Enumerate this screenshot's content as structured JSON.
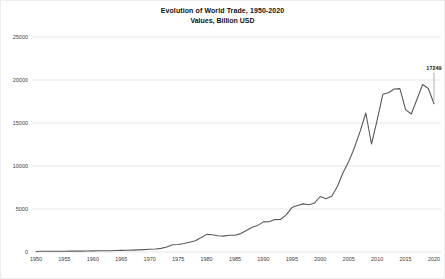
{
  "window": {
    "background": "#ffffff",
    "frame_color": "#ececec"
  },
  "chart_data": {
    "type": "line",
    "title": "Evolution of World Trade, 1950-2020",
    "subtitle": "Values, Billion USD",
    "xlabel": "",
    "ylabel": "",
    "grid": true,
    "legend": false,
    "ylim": [
      0,
      25000
    ],
    "y_ticks": [
      0,
      5000,
      10000,
      15000,
      20000,
      25000
    ],
    "x_tick_step": 5,
    "x_ticks": [
      1950,
      1955,
      1960,
      1965,
      1970,
      1975,
      1980,
      1985,
      1990,
      1995,
      2000,
      2005,
      2010,
      2015,
      2020
    ],
    "x": [
      1950,
      1951,
      1952,
      1953,
      1954,
      1955,
      1956,
      1957,
      1958,
      1959,
      1960,
      1961,
      1962,
      1963,
      1964,
      1965,
      1966,
      1967,
      1968,
      1969,
      1970,
      1971,
      1972,
      1973,
      1974,
      1975,
      1976,
      1977,
      1978,
      1979,
      1980,
      1981,
      1982,
      1983,
      1984,
      1985,
      1986,
      1987,
      1988,
      1989,
      1990,
      1991,
      1992,
      1993,
      1994,
      1995,
      1996,
      1997,
      1998,
      1999,
      2000,
      2001,
      2002,
      2003,
      2004,
      2005,
      2006,
      2007,
      2008,
      2009,
      2010,
      2011,
      2012,
      2013,
      2014,
      2015,
      2016,
      2017,
      2018,
      2019,
      2020
    ],
    "values": [
      62,
      82,
      80,
      82,
      86,
      95,
      104,
      112,
      108,
      116,
      130,
      136,
      143,
      155,
      173,
      190,
      206,
      217,
      240,
      275,
      318,
      354,
      419,
      579,
      840,
      877,
      992,
      1128,
      1307,
      1655,
      2049,
      2010,
      1883,
      1846,
      1956,
      1954,
      2138,
      2516,
      2869,
      3098,
      3496,
      3516,
      3766,
      3782,
      4326,
      5168,
      5404,
      5594,
      5501,
      5712,
      6452,
      6191,
      6492,
      7580,
      9218,
      10509,
      12130,
      14023,
      16160,
      12555,
      15301,
      18338,
      18513,
      18953,
      19002,
      16557,
      16043,
      17737,
      19475,
      19015,
      17249
    ],
    "annotation": {
      "x": 2020,
      "y": 17249,
      "label": "17249"
    },
    "line_color": "#5a5a5a",
    "grid_color": "#e7e7e7",
    "tick_label_color": "#3d3d3d",
    "annotation_color": "#222222",
    "leader_line_color": "#9a9a9a"
  }
}
